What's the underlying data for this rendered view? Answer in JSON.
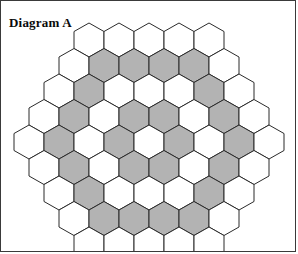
{
  "figure": {
    "title": "Diagram A",
    "border_color": "#3a3a3a",
    "background_color": "#ffffff"
  },
  "colors": {
    "hex_fill_white": "#ffffff",
    "hex_fill_gray": "#b3b3b3",
    "hex_stroke": "#2b2b2b",
    "title_color": "#0a0a0a"
  },
  "chart_data": {
    "type": "heatmap",
    "title": "Diagram A",
    "xlabel": "",
    "ylabel": "",
    "grid": false,
    "legend": "none",
    "shape": "pointy-top hexagons in offset rows",
    "total_cells": 61,
    "shaded_cells": 24,
    "unshaded_cells": 37,
    "categories": [
      "row 1",
      "row 2",
      "row 3",
      "row 4",
      "row 5",
      "row 6",
      "row 7",
      "row 8",
      "row 9"
    ],
    "row_counts": [
      5,
      6,
      7,
      8,
      9,
      8,
      7,
      6,
      5
    ],
    "shaded_per_row": [
      0,
      4,
      2,
      4,
      4,
      4,
      2,
      4,
      0
    ],
    "values": [
      [
        0,
        0,
        0,
        0,
        0
      ],
      [
        0,
        1,
        1,
        1,
        1,
        0
      ],
      [
        0,
        1,
        0,
        0,
        0,
        1,
        0
      ],
      [
        0,
        1,
        0,
        1,
        1,
        0,
        1,
        0
      ],
      [
        0,
        1,
        0,
        1,
        0,
        1,
        0,
        1,
        0
      ],
      [
        0,
        1,
        0,
        1,
        1,
        0,
        1,
        0
      ],
      [
        0,
        1,
        0,
        0,
        0,
        1,
        0
      ],
      [
        0,
        1,
        1,
        1,
        1,
        0
      ],
      [
        0,
        0,
        0,
        0,
        0
      ]
    ],
    "value_legend": {
      "0": "white / unshaded",
      "1": "gray / shaded"
    }
  },
  "geometry": {
    "hex_width": 30,
    "hex_height": 34,
    "row_step": 25.5,
    "origin_x": 73,
    "origin_y": 22
  }
}
